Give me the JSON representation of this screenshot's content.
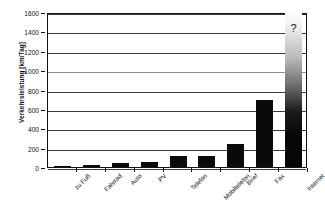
{
  "chart_data": {
    "type": "bar",
    "title": "",
    "subtitle": "",
    "xlabel": "",
    "ylabel": "Verkehrsleistung [km/Tag]",
    "ylim": [
      0,
      1600
    ],
    "ytick_step": 200,
    "yticks": [
      "1600",
      "1400",
      "1200",
      "1000",
      "800",
      "600",
      "400",
      "200",
      "0"
    ],
    "grid": true,
    "grid_orientation": "horizontal",
    "legend": false,
    "legend_position": "none",
    "categories": [
      "zu Fuß",
      "Fahrrad",
      "Auto",
      "PV",
      "Telefon",
      "Mobiltelefon",
      "Brief",
      "Fax",
      "Internet"
    ],
    "values": [
      15,
      25,
      45,
      50,
      110,
      110,
      235,
      690,
      1600
    ],
    "bar_color": "#0a0a0a",
    "annotations": [
      {
        "text": "?",
        "category": "Internet",
        "value": 1450,
        "note": "Internet bar drawn as a fade-out gradient with an open-ended question mark, value unknown"
      }
    ],
    "series": [
      {
        "name": "Verkehrsleistung",
        "values": [
          15,
          25,
          45,
          50,
          110,
          110,
          235,
          690,
          1600
        ]
      }
    ]
  }
}
